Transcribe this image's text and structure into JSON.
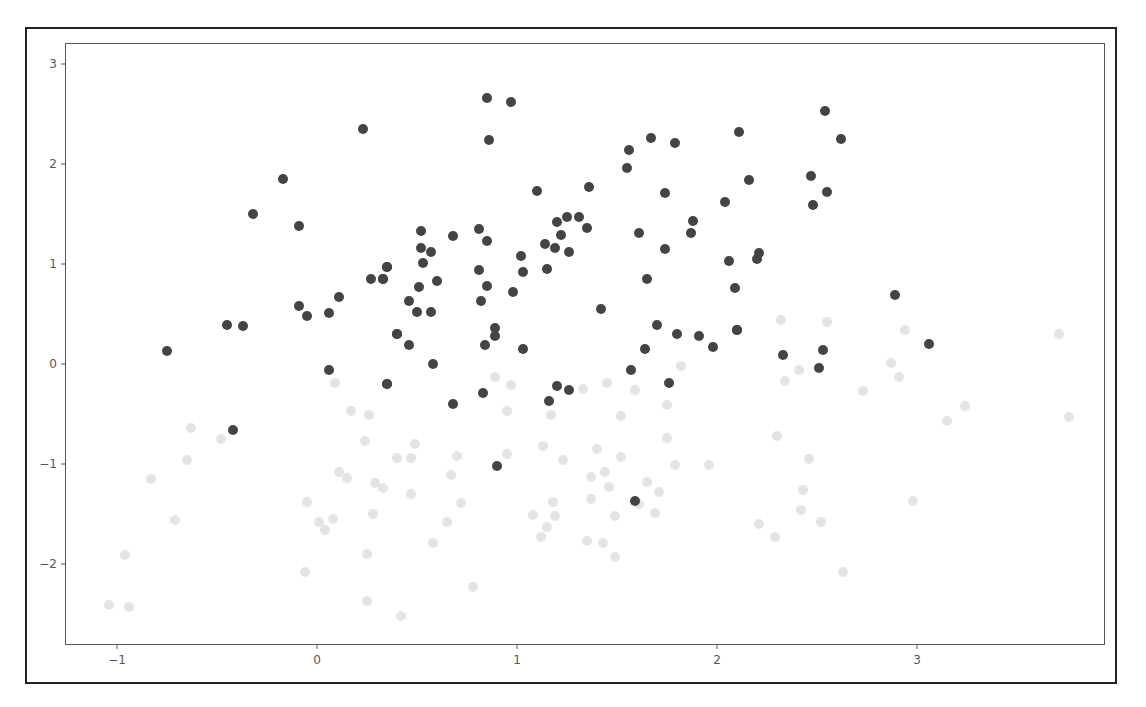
{
  "chart_data": {
    "type": "scatter",
    "title": "",
    "xlabel": "",
    "ylabel": "",
    "xlim": [
      -1.26,
      3.94
    ],
    "ylim": [
      -2.81,
      3.21
    ],
    "grid": false,
    "legend": null,
    "x_ticks": [
      -1,
      0,
      1,
      2,
      3
    ],
    "y_ticks": [
      -2,
      -1,
      0,
      1,
      2,
      3
    ],
    "x_tick_labels": [
      "−1",
      "0",
      "1",
      "2",
      "3"
    ],
    "y_tick_labels": [
      "−2",
      "−1",
      "0",
      "1",
      "2",
      "3"
    ],
    "series": [
      {
        "name": "class-dark",
        "color": "#444444",
        "points": [
          [
            0.23,
            2.35
          ],
          [
            -0.17,
            1.85
          ],
          [
            -0.32,
            1.5
          ],
          [
            -0.09,
            1.38
          ],
          [
            0.35,
            0.97
          ],
          [
            0.27,
            0.85
          ],
          [
            0.33,
            0.85
          ],
          [
            0.11,
            0.67
          ],
          [
            -0.09,
            0.58
          ],
          [
            -0.05,
            0.48
          ],
          [
            0.06,
            0.51
          ],
          [
            -0.45,
            0.39
          ],
          [
            -0.37,
            0.38
          ],
          [
            0.4,
            0.3
          ],
          [
            -0.75,
            0.13
          ],
          [
            0.06,
            -0.06
          ],
          [
            0.35,
            -0.2
          ],
          [
            -0.42,
            -0.66
          ],
          [
            0.85,
            2.66
          ],
          [
            0.97,
            2.62
          ],
          [
            0.86,
            2.24
          ],
          [
            1.67,
            2.26
          ],
          [
            1.79,
            2.21
          ],
          [
            1.56,
            2.14
          ],
          [
            1.55,
            1.96
          ],
          [
            1.1,
            1.73
          ],
          [
            1.36,
            1.77
          ],
          [
            1.74,
            1.71
          ],
          [
            0.52,
            1.33
          ],
          [
            0.68,
            1.28
          ],
          [
            0.81,
            1.35
          ],
          [
            0.85,
            1.23
          ],
          [
            1.2,
            1.42
          ],
          [
            1.25,
            1.47
          ],
          [
            1.31,
            1.47
          ],
          [
            1.35,
            1.36
          ],
          [
            1.22,
            1.29
          ],
          [
            1.14,
            1.2
          ],
          [
            1.19,
            1.16
          ],
          [
            1.26,
            1.12
          ],
          [
            1.61,
            1.31
          ],
          [
            1.74,
            1.15
          ],
          [
            0.52,
            1.16
          ],
          [
            0.57,
            1.12
          ],
          [
            0.53,
            1.01
          ],
          [
            0.35,
            0.97
          ],
          [
            0.33,
            0.85
          ],
          [
            0.51,
            0.77
          ],
          [
            0.6,
            0.83
          ],
          [
            0.81,
            0.94
          ],
          [
            1.02,
            1.08
          ],
          [
            1.03,
            0.92
          ],
          [
            1.15,
            0.95
          ],
          [
            1.65,
            0.85
          ],
          [
            0.85,
            0.78
          ],
          [
            0.98,
            0.72
          ],
          [
            0.46,
            0.63
          ],
          [
            0.5,
            0.52
          ],
          [
            0.57,
            0.52
          ],
          [
            0.82,
            0.63
          ],
          [
            1.42,
            0.55
          ],
          [
            0.89,
            0.36
          ],
          [
            0.89,
            0.28
          ],
          [
            0.4,
            0.3
          ],
          [
            0.46,
            0.19
          ],
          [
            0.84,
            0.19
          ],
          [
            1.03,
            0.15
          ],
          [
            1.7,
            0.39
          ],
          [
            1.8,
            0.3
          ],
          [
            1.64,
            0.15
          ],
          [
            0.58,
            -0.0
          ],
          [
            1.57,
            -0.06
          ],
          [
            0.35,
            -0.2
          ],
          [
            0.83,
            -0.29
          ],
          [
            1.2,
            -0.22
          ],
          [
            1.26,
            -0.26
          ],
          [
            1.76,
            -0.19
          ],
          [
            0.68,
            -0.4
          ],
          [
            1.16,
            -0.37
          ],
          [
            0.9,
            -1.02
          ],
          [
            1.59,
            -1.37
          ],
          [
            3.06,
            0.2
          ],
          [
            2.89,
            0.69
          ],
          [
            2.54,
            2.53
          ],
          [
            2.11,
            2.32
          ],
          [
            2.62,
            2.25
          ],
          [
            2.16,
            1.84
          ],
          [
            2.47,
            1.88
          ],
          [
            2.55,
            1.72
          ],
          [
            2.48,
            1.59
          ],
          [
            2.04,
            1.62
          ],
          [
            1.88,
            1.43
          ],
          [
            1.87,
            1.31
          ],
          [
            2.21,
            1.11
          ],
          [
            2.2,
            1.05
          ],
          [
            2.06,
            1.03
          ],
          [
            2.09,
            0.76
          ],
          [
            2.1,
            0.34
          ],
          [
            1.91,
            0.28
          ],
          [
            1.98,
            0.17
          ],
          [
            2.33,
            0.09
          ],
          [
            2.53,
            0.14
          ],
          [
            2.51,
            -0.04
          ],
          [
            2.1,
            0.34
          ]
        ]
      },
      {
        "name": "class-light",
        "color": "#e4e4e4",
        "points": [
          [
            0.09,
            -0.19
          ],
          [
            0.17,
            -0.47
          ],
          [
            0.26,
            -0.51
          ],
          [
            -0.63,
            -0.64
          ],
          [
            -0.48,
            -0.75
          ],
          [
            0.24,
            -0.77
          ],
          [
            0.49,
            -0.8
          ],
          [
            0.4,
            -0.94
          ],
          [
            0.47,
            -0.94
          ],
          [
            -0.65,
            -0.96
          ],
          [
            -0.83,
            -1.15
          ],
          [
            0.11,
            -1.08
          ],
          [
            0.15,
            -1.14
          ],
          [
            0.29,
            -1.19
          ],
          [
            0.33,
            -1.24
          ],
          [
            0.47,
            -1.3
          ],
          [
            -0.05,
            -1.38
          ],
          [
            0.28,
            -1.5
          ],
          [
            -0.71,
            -1.56
          ],
          [
            0.01,
            -1.58
          ],
          [
            0.08,
            -1.55
          ],
          [
            0.04,
            -1.66
          ],
          [
            -0.96,
            -1.91
          ],
          [
            0.25,
            -1.9
          ],
          [
            -0.06,
            -2.08
          ],
          [
            -1.04,
            -2.41
          ],
          [
            -0.94,
            -2.43
          ],
          [
            0.25,
            -2.37
          ],
          [
            0.42,
            -2.52
          ],
          [
            1.82,
            -0.02
          ],
          [
            0.89,
            -0.13
          ],
          [
            0.97,
            -0.21
          ],
          [
            1.33,
            -0.25
          ],
          [
            1.45,
            -0.19
          ],
          [
            1.59,
            -0.26
          ],
          [
            1.75,
            -0.41
          ],
          [
            0.95,
            -0.47
          ],
          [
            1.17,
            -0.51
          ],
          [
            1.52,
            -0.52
          ],
          [
            1.75,
            -0.74
          ],
          [
            1.13,
            -0.82
          ],
          [
            1.4,
            -0.85
          ],
          [
            0.7,
            -0.92
          ],
          [
            0.95,
            -0.9
          ],
          [
            1.23,
            -0.96
          ],
          [
            1.52,
            -0.93
          ],
          [
            1.79,
            -1.01
          ],
          [
            1.96,
            -1.01
          ],
          [
            0.67,
            -1.11
          ],
          [
            1.37,
            -1.13
          ],
          [
            1.44,
            -1.08
          ],
          [
            1.46,
            -1.23
          ],
          [
            1.65,
            -1.18
          ],
          [
            1.71,
            -1.28
          ],
          [
            0.72,
            -1.39
          ],
          [
            1.18,
            -1.38
          ],
          [
            1.37,
            -1.35
          ],
          [
            1.61,
            -1.4
          ],
          [
            1.08,
            -1.51
          ],
          [
            1.19,
            -1.52
          ],
          [
            1.49,
            -1.52
          ],
          [
            1.69,
            -1.49
          ],
          [
            0.65,
            -1.58
          ],
          [
            1.15,
            -1.63
          ],
          [
            1.12,
            -1.73
          ],
          [
            0.58,
            -1.79
          ],
          [
            1.35,
            -1.77
          ],
          [
            1.43,
            -1.79
          ],
          [
            1.49,
            -1.93
          ],
          [
            0.78,
            -2.23
          ],
          [
            2.32,
            0.44
          ],
          [
            2.55,
            0.42
          ],
          [
            2.94,
            0.34
          ],
          [
            3.71,
            0.3
          ],
          [
            2.41,
            -0.06
          ],
          [
            2.34,
            -0.17
          ],
          [
            2.87,
            0.01
          ],
          [
            2.91,
            -0.13
          ],
          [
            2.73,
            -0.27
          ],
          [
            3.24,
            -0.42
          ],
          [
            3.15,
            -0.57
          ],
          [
            3.76,
            -0.53
          ],
          [
            2.3,
            -0.72
          ],
          [
            2.46,
            -0.95
          ],
          [
            2.43,
            -1.26
          ],
          [
            2.98,
            -1.37
          ],
          [
            2.42,
            -1.46
          ],
          [
            2.21,
            -1.6
          ],
          [
            2.52,
            -1.58
          ],
          [
            2.29,
            -1.73
          ],
          [
            2.63,
            -2.08
          ]
        ]
      }
    ]
  }
}
